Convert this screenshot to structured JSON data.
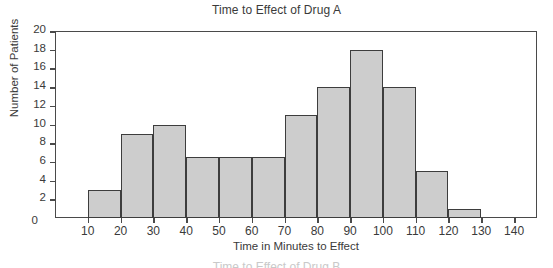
{
  "chart_data": {
    "type": "bar",
    "subtype": "histogram",
    "title": "Time to Effect of Drug A",
    "xlabel": "Time in Minutes to Effect",
    "ylabel": "Number of Patients",
    "categories": [
      "10-20",
      "20-30",
      "30-40",
      "40-50",
      "50-60",
      "60-70",
      "70-80",
      "80-90",
      "90-100",
      "100-110",
      "110-120",
      "120-130"
    ],
    "bin_edges": [
      10,
      20,
      30,
      40,
      50,
      60,
      70,
      80,
      90,
      100,
      110,
      120,
      130
    ],
    "values": [
      3,
      9,
      10,
      6.5,
      6.5,
      6.5,
      11,
      14,
      18,
      14,
      5,
      1
    ],
    "xlim": [
      0,
      147
    ],
    "ylim": [
      0,
      20
    ],
    "xticks": [
      10,
      20,
      30,
      40,
      50,
      60,
      70,
      80,
      90,
      100,
      110,
      120,
      130,
      140
    ],
    "yticks": [
      0,
      2,
      4,
      6,
      8,
      10,
      12,
      14,
      16,
      18,
      20
    ],
    "xtick_labels": [
      "10",
      "20",
      "30",
      "40",
      "50",
      "60",
      "70",
      "80",
      "90",
      "100",
      "110",
      "120",
      "130",
      "140"
    ],
    "ytick_labels": [
      "0",
      "2",
      "4",
      "6",
      "8",
      "10",
      "12",
      "14",
      "16",
      "18",
      "20"
    ],
    "grid": false,
    "legend": null,
    "bar_fill_color": "#cdcdcd",
    "bar_edge_color": "#3d3d3d",
    "axis_color": "#4a4a4a",
    "text_color": "#3a3a3a",
    "background_color": "#ffffff"
  },
  "cutoff_next_title": "Time to Effect of Drug B"
}
